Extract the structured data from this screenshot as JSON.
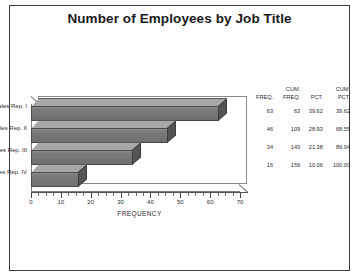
{
  "title": "Number of Employees by Job Title",
  "axis": {
    "y_title": "Employee Job Title",
    "x_title": "FREQUENCY"
  },
  "table": {
    "headers": [
      {
        "line1": "",
        "line2": "FREQ."
      },
      {
        "line1": "CUM.",
        "line2": "FREQ."
      },
      {
        "line1": "",
        "line2": "PCT."
      },
      {
        "line1": "CUM.",
        "line2": "PCT."
      }
    ],
    "rows": [
      {
        "freq": "63",
        "cum_freq": "63",
        "pct": "39.62",
        "cum_pct": "39.62"
      },
      {
        "freq": "46",
        "cum_freq": "109",
        "pct": "28.93",
        "cum_pct": "68.55"
      },
      {
        "freq": "34",
        "cum_freq": "143",
        "pct": "21.38",
        "cum_pct": "89.94"
      },
      {
        "freq": "16",
        "cum_freq": "159",
        "pct": "10.06",
        "cum_pct": "100.00"
      }
    ]
  },
  "chart_data": {
    "type": "bar",
    "orientation": "horizontal",
    "title": "Number of Employees by Job Title",
    "xlabel": "FREQUENCY",
    "ylabel": "Employee Job Title",
    "categories": [
      "Sales Rep. I",
      "Sales Rep. II",
      "Sales Rep. III",
      "Sales Rep. IV"
    ],
    "values": [
      63,
      46,
      34,
      16
    ],
    "xlim": [
      0,
      70
    ],
    "xticks": [
      0,
      10,
      20,
      30,
      40,
      50,
      60,
      70
    ],
    "xtick_labels": [
      "0",
      "10",
      "20",
      "30",
      "40",
      "50",
      "60",
      "70"
    ],
    "minor_tick_step": 2.5,
    "grid": false,
    "legend": false,
    "style": "3d-bar",
    "bar_color": "#787878",
    "bar_edge_color": "#4a4a4a",
    "bar_top_color": "#a8a8a8",
    "bar_cap_color": "#545454",
    "background": "#ffffff",
    "table": {
      "columns": [
        "FREQ.",
        "CUM. FREQ.",
        "PCT.",
        "CUM. PCT."
      ],
      "rows": [
        [
          "63",
          "63",
          "39.62",
          "39.62"
        ],
        [
          "46",
          "109",
          "28.93",
          "68.55"
        ],
        [
          "34",
          "143",
          "21.38",
          "89.94"
        ],
        [
          "16",
          "159",
          "10.06",
          "100.00"
        ]
      ]
    }
  }
}
